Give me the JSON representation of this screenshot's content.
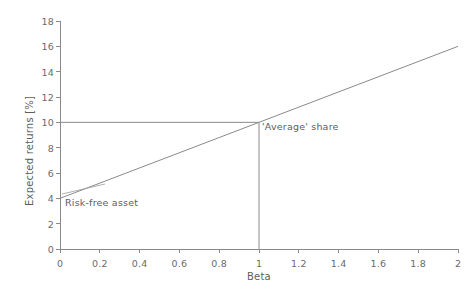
{
  "chart_data": {
    "type": "line",
    "title": "",
    "xlabel": "Beta",
    "ylabel": "Expected returns [%]",
    "xlim": [
      0,
      2
    ],
    "ylim": [
      0,
      18
    ],
    "grid": false,
    "legend": "none",
    "xticks": [
      "0",
      "0.2",
      "0.4",
      "0.6",
      "0.8",
      "1",
      "1.2",
      "1.4",
      "1.6",
      "1.8",
      "2"
    ],
    "xtick_values": [
      0,
      0.2,
      0.4,
      0.6,
      0.8,
      1,
      1.2,
      1.4,
      1.6,
      1.8,
      2
    ],
    "yticks": [
      "0",
      "2",
      "4",
      "6",
      "8",
      "10",
      "12",
      "14",
      "16",
      "18"
    ],
    "ytick_values": [
      0,
      2,
      4,
      6,
      8,
      10,
      12,
      14,
      16,
      18
    ],
    "series": [
      {
        "name": "Security market line",
        "x": [
          0,
          2
        ],
        "values": [
          4,
          16
        ],
        "intercept": 4,
        "slope": 6,
        "color": "#8a8a8a"
      },
      {
        "name": "Expected return guide at beta 1",
        "x": [
          0,
          1
        ],
        "values": [
          10,
          10
        ],
        "color": "#8a8a8a"
      },
      {
        "name": "Beta guide at beta 1",
        "x": [
          1,
          1
        ],
        "values": [
          10,
          0
        ],
        "color": "#8a8a8a"
      }
    ],
    "annotations": [
      {
        "name": "risk-free-asset",
        "text": "Risk-free asset",
        "x": 0,
        "y": 4
      },
      {
        "name": "average-share",
        "text": "'Average' share",
        "x": 1,
        "y": 10
      }
    ],
    "colors": {
      "line": "#8a8a8a",
      "axis": "#8a8a8a",
      "text": "#5d5d5d",
      "background": "#ffffff"
    }
  }
}
